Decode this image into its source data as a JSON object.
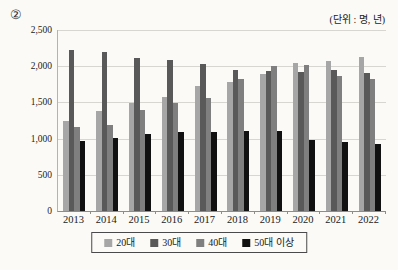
{
  "page": {
    "marker": "②",
    "unit_label": "(단위 : 명, 년)"
  },
  "colors": {
    "background": "#fbfaf7",
    "gridline": "#d8d6d1",
    "axis": "#8f8d88"
  },
  "chart_data": {
    "type": "bar",
    "title": "",
    "unit_note": "(단위 : 명, 년)",
    "categories": [
      "2013",
      "2014",
      "2015",
      "2016",
      "2017",
      "2018",
      "2019",
      "2020",
      "2021",
      "2022"
    ],
    "series": [
      {
        "name": "20대",
        "color": "#a6a6a6",
        "values": [
          1250,
          1380,
          1490,
          1580,
          1730,
          1780,
          1890,
          2040,
          2070,
          2130
        ]
      },
      {
        "name": "30대",
        "color": "#595959",
        "values": [
          2230,
          2190,
          2110,
          2080,
          2030,
          1950,
          1940,
          1920,
          1950,
          1910
        ]
      },
      {
        "name": "40대",
        "color": "#7f7f7f",
        "values": [
          1160,
          1190,
          1400,
          1490,
          1560,
          1820,
          2010,
          2020,
          1870,
          1830
        ]
      },
      {
        "name": "50대 이상",
        "color": "#111111",
        "values": [
          970,
          1010,
          1060,
          1090,
          1090,
          1100,
          1110,
          980,
          960,
          930
        ]
      }
    ],
    "xlabel": "",
    "ylabel": "",
    "ylim": [
      0,
      2500
    ],
    "ytick_interval": 500,
    "ytick_labels": [
      "0",
      "500",
      "1,000",
      "1,500",
      "2,000",
      "2,500"
    ],
    "grid": true,
    "legend_position": "bottom"
  }
}
